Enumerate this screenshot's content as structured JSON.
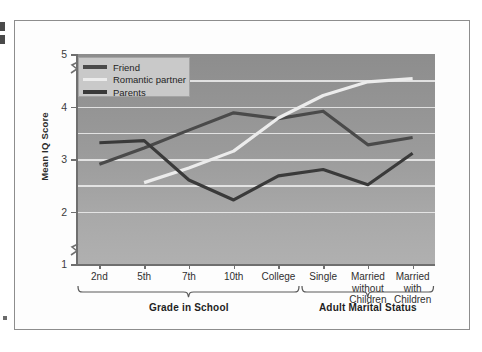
{
  "chart_data": {
    "type": "line",
    "title": "",
    "xlabel": "",
    "ylabel": "Mean IQ Score",
    "ylim": [
      1,
      5
    ],
    "yticks": [
      1,
      2,
      3,
      4,
      5
    ],
    "ytick_labels": [
      "1",
      "2",
      "3",
      "4",
      "5"
    ],
    "gridlines": [
      2.0,
      2.5,
      3.0,
      3.5,
      4.0,
      4.5
    ],
    "grid": true,
    "axis_break": "between 1 and 2 on the y-axis",
    "legend_position": "top-left inside plot",
    "categories": [
      "2nd",
      "5th",
      "7th",
      "10th",
      "College",
      "Single",
      "Married without Children",
      "Married with Children"
    ],
    "series": [
      {
        "name": "Friend",
        "color": "#4a4a4a",
        "values": [
          2.9,
          3.21,
          3.55,
          3.88,
          3.77,
          3.91,
          3.27,
          3.41
        ]
      },
      {
        "name": "Romantic partner",
        "color": "#ececec",
        "values": [
          null,
          2.55,
          2.83,
          3.15,
          3.78,
          4.21,
          4.47,
          4.53
        ]
      },
      {
        "name": "Parents",
        "color": "#3a3a3a",
        "values": [
          3.31,
          3.35,
          2.6,
          2.22,
          2.68,
          2.8,
          2.51,
          3.11
        ]
      }
    ],
    "groups": [
      {
        "label": "Grade in School",
        "from": "2nd",
        "to": "College"
      },
      {
        "label": "Adult Marital Status",
        "from": "Single",
        "to": "Married with Children"
      }
    ]
  },
  "legend": {
    "items": [
      {
        "label": "Friend",
        "color": "#4a4a4a"
      },
      {
        "label": "Romantic partner",
        "color": "#ececec"
      },
      {
        "label": "Parents",
        "color": "#3a3a3a"
      }
    ]
  },
  "axes": {
    "y_title": "Mean IQ Score",
    "y_labels": [
      "5",
      "4",
      "3",
      "2",
      "1"
    ],
    "x_labels": [
      "2nd",
      "5th",
      "7th",
      "10th",
      "College",
      "Single",
      "Married\nwithout\nChildren",
      "Married\nwith\nChildren"
    ]
  },
  "groups": {
    "left_label": "Grade in School",
    "right_label": "Adult Marital Status"
  },
  "colors": {
    "plot_bg_top": "#8d8d8d",
    "plot_bg_bottom": "#b0b0b0",
    "gridline": "#eeeeee",
    "axis": "#6f6f6f",
    "frame": "#8d8d8d",
    "legend_bg": "#c9c9c9"
  }
}
